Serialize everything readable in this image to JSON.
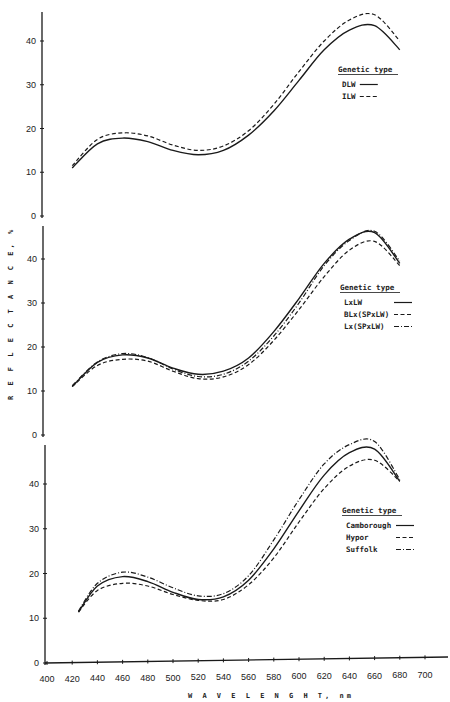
{
  "chart_data": [
    {
      "type": "line",
      "panel": "top",
      "title": "",
      "xlabel": "WAVELENGHT, nm",
      "ylabel": "REFLECTANCE, %",
      "xlim": [
        400,
        700
      ],
      "ylim": [
        0,
        45
      ],
      "yticks": [
        0,
        10,
        20,
        30,
        40
      ],
      "grid": false,
      "legend": {
        "title": "Genetic type",
        "position": "right-middle"
      },
      "x": [
        420,
        440,
        460,
        480,
        500,
        520,
        540,
        560,
        580,
        600,
        620,
        640,
        660,
        680
      ],
      "series": [
        {
          "name": "DLW",
          "style": "solid",
          "values": [
            11.0,
            16.5,
            17.8,
            17.0,
            15.0,
            14.0,
            15.0,
            18.5,
            24.0,
            31.0,
            38.0,
            42.5,
            43.5,
            38.0
          ]
        },
        {
          "name": "ILW",
          "style": "dashed",
          "values": [
            11.5,
            17.5,
            19.0,
            18.3,
            16.2,
            15.0,
            16.0,
            19.5,
            25.5,
            33.0,
            40.0,
            44.8,
            46.0,
            40.0
          ]
        }
      ]
    },
    {
      "type": "line",
      "panel": "middle",
      "title": "",
      "xlabel": "WAVELENGHT, nm",
      "ylabel": "REFLECTANCE, %",
      "xlim": [
        400,
        700
      ],
      "ylim": [
        0,
        47
      ],
      "yticks": [
        0,
        10,
        20,
        30,
        40
      ],
      "grid": false,
      "legend": {
        "title": "Genetic type",
        "position": "right-middle"
      },
      "x": [
        420,
        440,
        460,
        480,
        500,
        520,
        540,
        560,
        580,
        600,
        620,
        640,
        660,
        680
      ],
      "series": [
        {
          "name": "LxLW",
          "style": "solid",
          "values": [
            11.0,
            16.5,
            18.2,
            17.5,
            15.2,
            13.8,
            14.5,
            17.5,
            23.5,
            31.0,
            39.0,
            44.5,
            46.0,
            39.0
          ]
        },
        {
          "name": "BLx(SPxLW)",
          "style": "dashed",
          "values": [
            11.0,
            15.8,
            17.2,
            16.8,
            14.5,
            12.8,
            13.2,
            16.0,
            21.5,
            28.5,
            36.0,
            42.0,
            44.0,
            38.5
          ]
        },
        {
          "name": "Lx(SPxLW)",
          "style": "dashdot",
          "values": [
            11.2,
            16.6,
            18.5,
            17.6,
            15.0,
            13.3,
            13.8,
            16.8,
            22.5,
            30.0,
            38.5,
            44.2,
            46.3,
            39.5
          ]
        }
      ]
    },
    {
      "type": "line",
      "panel": "bottom",
      "title": "",
      "xlabel": "WAVELENGHT, nm",
      "ylabel": "REFLECTANCE, %",
      "xlim": [
        400,
        700
      ],
      "ylim": [
        0,
        48
      ],
      "xticks": [
        400,
        420,
        440,
        460,
        480,
        500,
        520,
        540,
        560,
        580,
        600,
        620,
        640,
        660,
        680,
        700
      ],
      "yticks": [
        0,
        10,
        20,
        30,
        40
      ],
      "grid": false,
      "legend": {
        "title": "Genetic type",
        "position": "right-middle"
      },
      "x": [
        425,
        440,
        460,
        480,
        500,
        520,
        540,
        560,
        580,
        600,
        620,
        640,
        660,
        680
      ],
      "series": [
        {
          "name": "Camborough",
          "style": "solid",
          "values": [
            11.4,
            17.2,
            19.3,
            18.2,
            15.8,
            14.2,
            14.8,
            18.5,
            25.5,
            34.0,
            42.0,
            47.0,
            47.8,
            40.6
          ]
        },
        {
          "name": "Hypor",
          "style": "dashed",
          "values": [
            11.4,
            16.2,
            17.8,
            17.2,
            15.3,
            14.0,
            14.2,
            17.5,
            23.5,
            31.5,
            39.0,
            44.0,
            45.3,
            40.6
          ]
        },
        {
          "name": "Suffolk",
          "style": "dashdot",
          "values": [
            11.6,
            17.8,
            20.3,
            19.2,
            16.8,
            15.0,
            15.5,
            19.5,
            27.5,
            36.5,
            44.5,
            48.8,
            49.5,
            41.0
          ]
        }
      ]
    }
  ],
  "labels": {
    "ylabel": "R E F L E C T A N C E,  %",
    "xlabel": "W A V E L E N G H T,  nm",
    "legend_title": "Genetic type"
  },
  "colors": {
    "line": "#1a1a1a",
    "background": "#ffffff"
  }
}
